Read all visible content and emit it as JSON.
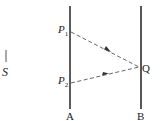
{
  "diagram": {
    "source_label": "S",
    "mirror_a_label": "A",
    "mirror_b_label": "B",
    "point_p1": {
      "letter": "P",
      "sub": "1"
    },
    "point_p2": {
      "letter": "P",
      "sub": "2"
    },
    "point_q": "Q",
    "colors": {
      "line": "#444444",
      "text": "#222222"
    }
  }
}
